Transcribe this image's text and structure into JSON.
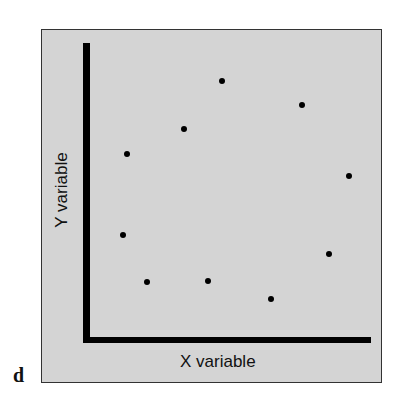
{
  "panel_label": "d",
  "chart_data": {
    "type": "scatter",
    "title": "",
    "xlabel": "X variable",
    "ylabel": "Y variable",
    "grid": false,
    "legend": null,
    "xlim": [
      0,
      100
    ],
    "ylim": [
      0,
      100
    ],
    "points": [
      {
        "x": 47,
        "y": 88
      },
      {
        "x": 75,
        "y": 80
      },
      {
        "x": 35,
        "y": 72
      },
      {
        "x": 15,
        "y": 64
      },
      {
        "x": 92,
        "y": 56
      },
      {
        "x": 14,
        "y": 37
      },
      {
        "x": 85,
        "y": 30
      },
      {
        "x": 22,
        "y": 20
      },
      {
        "x": 44,
        "y": 21
      },
      {
        "x": 66,
        "y": 15
      }
    ],
    "pixel_points": [
      [
        222,
        81
      ],
      [
        302,
        105
      ],
      [
        184,
        129
      ],
      [
        127,
        154
      ],
      [
        349,
        176
      ],
      [
        123,
        235
      ],
      [
        329,
        254
      ],
      [
        147,
        282
      ],
      [
        208,
        281
      ],
      [
        271,
        299
      ]
    ]
  }
}
